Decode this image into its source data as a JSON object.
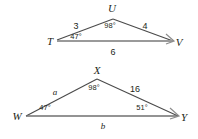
{
  "figure": {
    "stroke_color": "#3f3f3f",
    "base_color": "#8c8c8c",
    "text_color": "#231f20",
    "background": "#ffffff"
  },
  "triangles": [
    {
      "name": "triangle-TUV",
      "vertices": [
        {
          "label": "T",
          "x": 50,
          "y": 41
        },
        {
          "label": "U",
          "x": 112,
          "y": 8
        },
        {
          "label": "V",
          "x": 179,
          "y": 42
        }
      ],
      "sides": [
        {
          "label": "3",
          "x": 76,
          "y": 26,
          "type": "number"
        },
        {
          "label": "4",
          "x": 145,
          "y": 26,
          "type": "number"
        },
        {
          "label": "6",
          "x": 113,
          "y": 52,
          "type": "number"
        }
      ],
      "angles": [
        {
          "label": "98°",
          "x": 110,
          "y": 26
        },
        {
          "label": "47°",
          "x": 76,
          "y": 37
        }
      ],
      "tick_mark": {
        "name": "congruence-tick-V",
        "x": 166,
        "y": 38
      }
    },
    {
      "name": "triangle-WXY",
      "vertices": [
        {
          "label": "W",
          "x": 17,
          "y": 116
        },
        {
          "label": "X",
          "x": 97,
          "y": 70
        },
        {
          "label": "Y",
          "x": 184,
          "y": 117
        }
      ],
      "sides": [
        {
          "label": "a",
          "x": 55,
          "y": 92,
          "type": "variable"
        },
        {
          "label": "16",
          "x": 135,
          "y": 89,
          "type": "number"
        },
        {
          "label": "b",
          "x": 103,
          "y": 126,
          "type": "variable"
        }
      ],
      "angles": [
        {
          "label": "98°",
          "x": 94,
          "y": 88
        },
        {
          "label": "47°",
          "x": 45,
          "y": 108
        },
        {
          "label": "51°",
          "x": 142,
          "y": 108
        }
      ],
      "tick_mark": {
        "name": "congruence-tick-Y",
        "x": 171,
        "y": 113
      }
    }
  ]
}
